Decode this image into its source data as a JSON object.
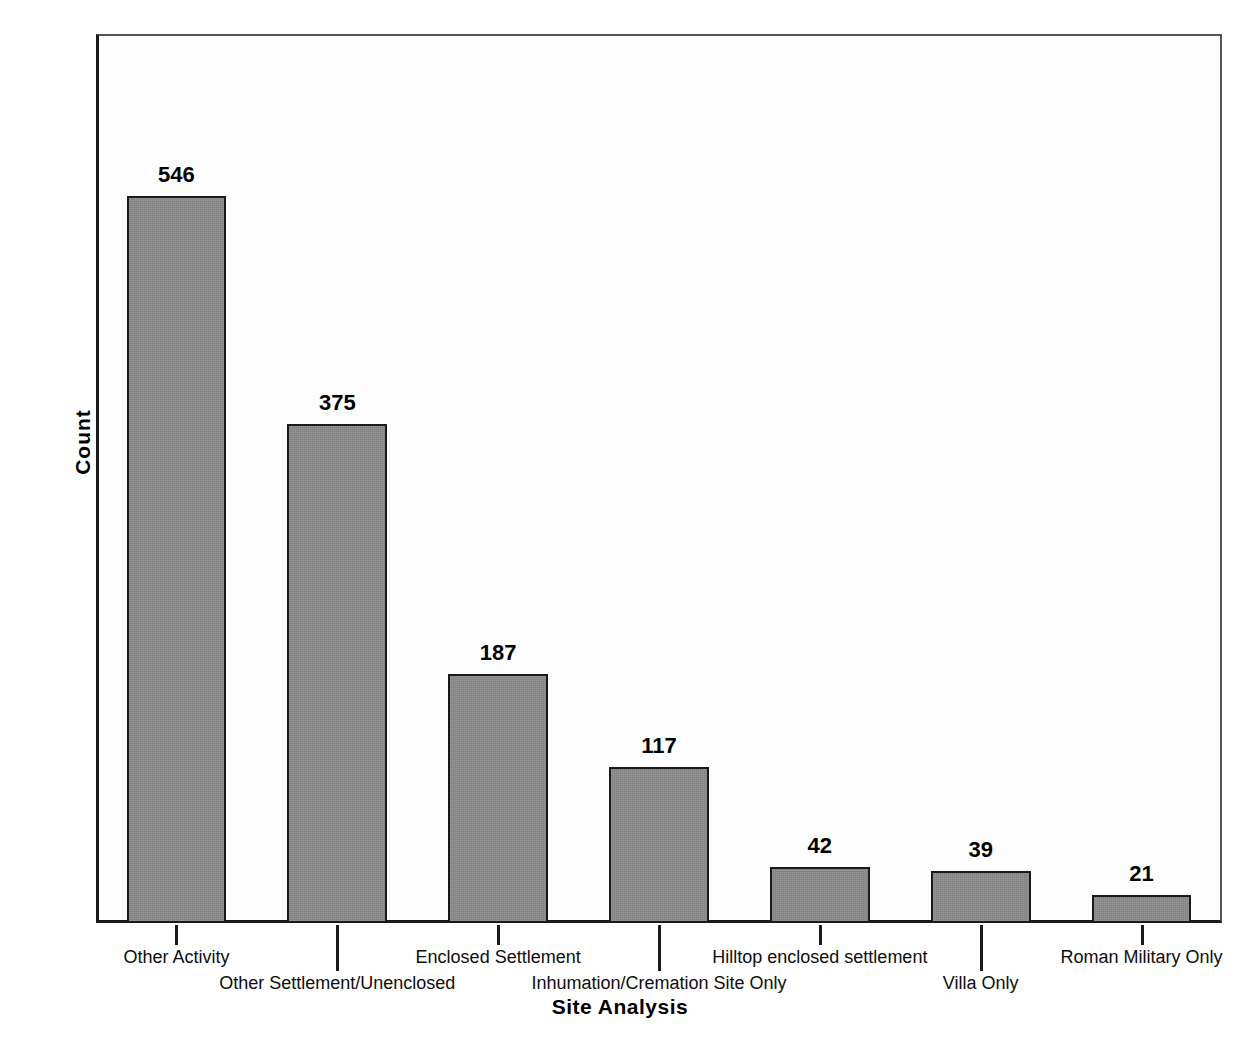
{
  "chart_data": {
    "type": "bar",
    "title": "",
    "xlabel": "Site Analysis",
    "ylabel": "Count",
    "categories": [
      "Other Activity",
      "Other Settlement/Unenclosed",
      "Enclosed Settlement",
      "Inhumation/Cremation Site Only",
      "Hilltop enclosed settlement",
      "Villa Only",
      "Roman Military Only"
    ],
    "values": [
      546,
      375,
      187,
      117,
      42,
      39,
      21
    ],
    "data_labels": [
      "546",
      "375",
      "187",
      "117",
      "42",
      "39",
      "21"
    ],
    "ylim": [
      0,
      668
    ],
    "yticks": [
      0,
      100,
      200,
      300,
      400,
      500,
      600
    ],
    "ytick_labels": [
      "0",
      "100",
      "200",
      "300",
      "400",
      "500",
      "600"
    ],
    "grid": false,
    "legend": null,
    "bar_color": "#8b8b8b",
    "bar_edge_color": "#1a1a1a",
    "plot_background": "#fdfdfd",
    "axis_color": "#1a1a1a"
  }
}
